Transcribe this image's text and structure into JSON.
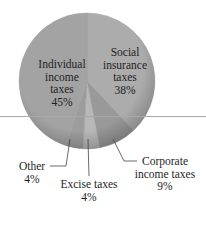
{
  "chart_data": {
    "type": "pie",
    "title": "",
    "categories": [
      "Individual income taxes",
      "Social insurance taxes",
      "Corporate income taxes",
      "Excise taxes",
      "Other"
    ],
    "values": [
      45,
      38,
      9,
      4,
      4
    ],
    "unit": "%",
    "labels": {
      "individual": {
        "line1": "Individual",
        "line2": "income",
        "line3": "taxes",
        "pct": "45%"
      },
      "social": {
        "line1": "Social",
        "line2": "insurance",
        "line3": "taxes",
        "pct": "38%"
      },
      "corporate": {
        "line1": "Corporate",
        "line2": "income taxes",
        "pct": "9%"
      },
      "excise": {
        "line1": "Excise taxes",
        "pct": "4%"
      },
      "other": {
        "line1": "Other",
        "pct": "4%"
      }
    },
    "slice_order_clockwise_from_top": [
      "Social insurance taxes",
      "Corporate income taxes",
      "Excise taxes",
      "Other",
      "Individual income taxes"
    ],
    "colors": {
      "individual": "#a3a3a3",
      "social": "#acacac",
      "corporate": "#999999",
      "excise": "#b8b8b8",
      "other": "#9d9d9d"
    },
    "legend": "none (direct labels)"
  }
}
